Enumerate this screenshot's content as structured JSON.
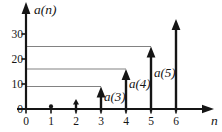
{
  "figure": {
    "ylabel": "a(n)",
    "xlabel": "n"
  },
  "colors": {
    "axis": "#151515",
    "stem": "#151515",
    "reference_line": "#828282",
    "background": "#ffffff",
    "text": "#151515"
  },
  "chart_data": {
    "type": "stem",
    "title": "",
    "xlabel": "n",
    "ylabel": "a(n)",
    "x": [
      1,
      2,
      3,
      4,
      5,
      6
    ],
    "values": [
      1,
      4,
      9,
      16,
      25,
      36
    ],
    "xticks": [
      "0",
      "1",
      "2",
      "3",
      "4",
      "5",
      "6"
    ],
    "xtick_values": [
      0,
      1,
      2,
      3,
      4,
      5,
      6
    ],
    "yticks": [
      "0",
      "10",
      "20",
      "30"
    ],
    "ytick_values": [
      0,
      10,
      20,
      30
    ],
    "xlim": [
      0,
      7.5
    ],
    "ylim": [
      0,
      42
    ],
    "grid": false,
    "legend": null,
    "reference_lines": [
      {
        "value": 9,
        "to_x": 3
      },
      {
        "value": 16,
        "to_x": 4
      },
      {
        "value": 25,
        "to_x": 5
      }
    ],
    "annotations": [
      {
        "text": "a(3)",
        "x": 3.12,
        "y": 5.2
      },
      {
        "text": "a(4)",
        "x": 4.12,
        "y": 10.2
      },
      {
        "text": "a(5)",
        "x": 5.12,
        "y": 14.6
      }
    ]
  }
}
